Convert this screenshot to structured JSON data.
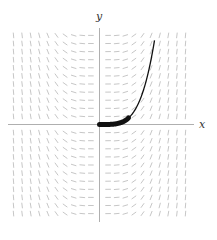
{
  "chart_data": {
    "type": "line",
    "title": "",
    "subtitle": "Slope field for dy/dx = x^3 with solution curve y = x^4/4 through the origin",
    "xlabel": "x",
    "ylabel": "y",
    "grid": false,
    "legend": null,
    "slope_field": {
      "equation": "dy/dx = x^3",
      "columns": 20,
      "rows": 22,
      "x_range": [
        -2.2,
        2.2
      ],
      "y_range": [
        -2.2,
        2.2
      ],
      "segment_color": "#b8b8b8"
    },
    "series": [
      {
        "name": "solution curve",
        "equation": "y = x^4/4",
        "x": [
          0,
          0.2,
          0.4,
          0.6,
          0.8,
          1.0,
          1.2,
          1.4,
          1.6,
          1.8,
          1.95
        ],
        "y": [
          0,
          0.0004,
          0.0064,
          0.0324,
          0.1024,
          0.25,
          0.5184,
          0.9604,
          1.6384,
          2.6244,
          3.6
        ],
        "color": "#111111"
      },
      {
        "name": "highlighted initial segment",
        "x_range": [
          0,
          0.7
        ],
        "color": "#111111",
        "style": "thick"
      }
    ],
    "xlim": [
      -2.2,
      2.2
    ],
    "ylim": [
      -2.2,
      2.2
    ]
  },
  "axes": {
    "x_label": "x",
    "y_label": "y",
    "axis_color": "#9a9a9a"
  }
}
